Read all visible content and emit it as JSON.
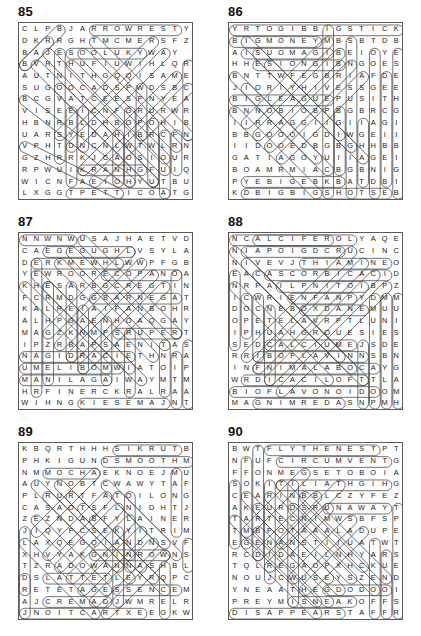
{
  "page": {
    "columns": 2,
    "rows": 3,
    "grid_size": 15,
    "ink_color": "#1a1a1a",
    "border_color": "#5a5a5a",
    "mark_color": "#4a4a4a"
  },
  "puzzles": [
    {
      "number": "85",
      "position": {
        "left": 0,
        "top": 0
      },
      "rows": [
        "CLPBJARROWRESTY",
        "DKRRGHTMCMERSFZ",
        "BAJESOOLUKYWAY",
        "BVRTHUFIUWIHLQR",
        "AUTNITHGQQISAME",
        "SUGOOCADSPWDSBC",
        "BCGVATCEESPNYEA",
        "VISEEICNFGRURWR",
        "HBNRBLDHBOPOHIB",
        "UARSYEDAHIBRCFN",
        "VPHTDNCNLWTWLRN",
        "GZHRRKJCAOSIOUR",
        "RPWUIKRANHGFUIQ",
        "WICNFAEIOHYUTBU",
        "LXGGTPETTICOATG"
      ]
    },
    {
      "number": "86",
      "position": {
        "left": 210,
        "top": 0
      },
      "rows": [
        "YRTOGIBBIGSTICK",
        "BIGMONEYMBSBTDB",
        "AISUOMAGIBEIOYE",
        "HHESIONGIBNGOES",
        "BNTTWFEGBRIAFDE",
        "JIORIYHIVESSGEE",
        "BIGLEAGUEPUSITH",
        "BNNOBIOBPBGBRCG",
        "IIRRAGGIIGIIAGI",
        "BBGOOOIGDIWGEII",
        "IIDOOEDBGBGHHBB",
        "GATIAGOYUIIAGEI",
        "BOAMRMIACBGBNIG",
        "PYEBIGEBKBATDBI",
        "KDBIGBIGSHOTSEB"
      ]
    },
    {
      "number": "87",
      "position": {
        "left": 0,
        "top": 210
      },
      "rows": [
        "NNWNWUSAJHAETVD",
        "CAEGEGUGHLVSYLA",
        "DERKMEWHLWWPFGB",
        "YEWROORECOPANOA",
        "KHESARBGCREGTIN",
        "FCRMDGGBARNEGAT",
        "KALREIAIFANBOHR",
        "ALHPGAENHOAQGAY",
        "MAGZKNMPSRUPERT",
        "IPZRBAPSAENITAS",
        "NAGIDRACIETHNRA",
        "UMELIBOMWIATOIP",
        "MANILAGAIWAYMTM",
        "HRFINERCKRALRAA",
        "WIHNGKIESEMAJNT"
      ]
    },
    {
      "number": "88",
      "position": {
        "left": 210,
        "top": 210
      },
      "rows": [
        "NCALCIFEROLYAQE",
        "NIAPOIGDCRUCINC",
        "NIVEVJTHIAMINEO",
        "EACASCORBICACID",
        "NRPAILPNITOIBPZ",
        "ICWRIENFANPYDMM",
        "DOCNEBOXDANEMUU",
        "OPETELAVRPTLUNI",
        "IPHUAHGROUESIES",
        "SEDCALCIUMEJSDE",
        "RRIBOFLAVINNSBN",
        "INFNIMALABOCAYG",
        "WRDICACILOFTTLA",
        "BIOFLAVONOIDOOM",
        "MAGNIMREDASNPMH"
      ]
    },
    {
      "number": "89",
      "position": {
        "left": 0,
        "top": 420
      },
      "rows": [
        "KBQRTHHHSIKRUTB",
        "PHKIGUNDSMOOTHM",
        "NMMOCHAEKNOEJMU",
        "AUYNOBTCWAWYTAF",
        "PLRURTFATOILONG",
        "CASAOTSFLNIDHTJ",
        "ZEZNDABFYLAINER",
        "JIQYFCSEKYITRIM",
        "LAXQEGQIANDNSVF",
        "XHVYAKGNINROWNS",
        "TZRADOWANNASHBLI",
        "DSLATTETLEYRQPC",
        "RETETAGESSENCEM",
        "AJCREMADJWMRELR",
        "JNOITCARTXEEGKW"
      ]
    },
    {
      "number": "90",
      "position": {
        "left": 210,
        "top": 420
      },
      "rows": [
        "BWTFLYTHENESTPT",
        "NFUFCIRCUMVENTG",
        "FFONMEGSETOBOIA",
        "SOKITILIATHGIHG",
        "CEARINBBLCZYFEZ",
        "AKEURDSRUNAWAYT",
        "TARTECNIMWSBFSP",
        "TMBFOTAAALADUPE",
        "EGENANSTIIUATWT",
        "RCDIDAEILNHYARS",
        "TQLREGAOPXHCKUE",
        "NOUJCWUSEYSZEND",
        "YNEAATHEGDODOOI",
        "PREYMISNEAKOFFS",
        "DISAPPEARSTAFFR"
      ]
    }
  ]
}
